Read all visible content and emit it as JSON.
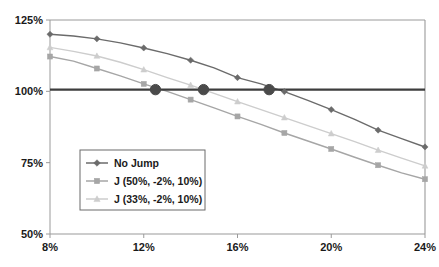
{
  "chart_data": {
    "type": "line",
    "title": "",
    "subtitle": "",
    "xlabel": "",
    "ylabel": "",
    "xlim": [
      8,
      24
    ],
    "ylim": [
      50,
      125
    ],
    "grid": false,
    "legend_position": "inner-bottom-left",
    "x_tick_labels": [
      "8%",
      "12%",
      "16%",
      "20%",
      "24%"
    ],
    "x_ticks": [
      8,
      12,
      16,
      20,
      24
    ],
    "y_tick_labels": [
      "50%",
      "75%",
      "100%",
      "125%"
    ],
    "y_ticks": [
      50,
      75,
      100,
      125
    ],
    "x": [
      8,
      9,
      10,
      11,
      12,
      13,
      14,
      15,
      16,
      17,
      18,
      19,
      20,
      21,
      22,
      23,
      24
    ],
    "marker_x": [
      8,
      10,
      12,
      14,
      16,
      18,
      20,
      22,
      24
    ],
    "series": [
      {
        "name": "No Jump",
        "marker": "diamond",
        "color": "#6b6b6b",
        "values": [
          120.0,
          119.4,
          118.4,
          117.0,
          115.2,
          113.2,
          110.9,
          108.2,
          104.8,
          102.6,
          99.9,
          96.8,
          93.6,
          90.2,
          86.4,
          83.4,
          80.5
        ]
      },
      {
        "name": "J (50%, -2%, 10%)",
        "marker": "square",
        "color": "#a6a6a6",
        "values": [
          112.2,
          110.6,
          108.0,
          105.4,
          102.6,
          100.0,
          97.1,
          94.2,
          91.2,
          88.4,
          85.4,
          82.6,
          79.8,
          76.9,
          74.1,
          71.4,
          69.2
        ]
      },
      {
        "name": "J (33%, -2%, 10%)",
        "marker": "triangle",
        "color": "#cdcdcd",
        "values": [
          115.4,
          114.0,
          112.4,
          110.2,
          107.6,
          104.8,
          102.2,
          99.3,
          96.4,
          93.6,
          90.8,
          88.0,
          85.2,
          82.4,
          79.4,
          76.6,
          73.9
        ]
      }
    ],
    "reference_line": {
      "name": "100% reference",
      "y": 100.6,
      "color": "#3d3d3d"
    },
    "crossing_markers": {
      "name": "breakeven-points",
      "color": "#4a4a4a",
      "points": [
        {
          "x": 12.5,
          "y": 100.6
        },
        {
          "x": 14.55,
          "y": 100.6
        },
        {
          "x": 17.35,
          "y": 100.6
        }
      ]
    },
    "legend": {
      "entries": [
        {
          "label": "No Jump",
          "marker": "diamond",
          "color": "#6b6b6b"
        },
        {
          "label": "J (50%, -2%, 10%)",
          "marker": "square",
          "color": "#a6a6a6"
        },
        {
          "label": "J (33%, -2%, 10%)",
          "marker": "triangle",
          "color": "#cdcdcd"
        }
      ]
    },
    "colors": {
      "axis": "#9a9a9a",
      "text": "#1a1a1a",
      "background": "#ffffff",
      "legend_border": "#6b6b6b"
    }
  }
}
